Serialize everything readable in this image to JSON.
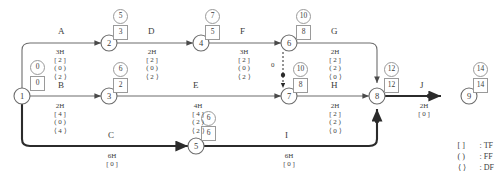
{
  "diagram": {
    "nodes": [
      {
        "id": "1",
        "label": "1",
        "earliest": "0",
        "latest": "0"
      },
      {
        "id": "2",
        "label": "2",
        "earliest": "5",
        "latest": "3"
      },
      {
        "id": "3",
        "label": "3",
        "earliest": "6",
        "latest": "2"
      },
      {
        "id": "4",
        "label": "4",
        "earliest": "7",
        "latest": "5"
      },
      {
        "id": "5",
        "label": "5",
        "earliest": "6",
        "latest": "6"
      },
      {
        "id": "6",
        "label": "6",
        "earliest": "10",
        "latest": "8"
      },
      {
        "id": "7",
        "label": "7",
        "earliest": "10",
        "latest": "8"
      },
      {
        "id": "8",
        "label": "8",
        "earliest": "12",
        "latest": "12"
      },
      {
        "id": "9",
        "label": "9",
        "earliest": "14",
        "latest": "14"
      }
    ],
    "activities": [
      {
        "name": "A",
        "from": "1",
        "to": "2",
        "duration": "3H",
        "tf": "[ 2 ]",
        "ff": "( 0 )",
        "df": "⟨ 2 ⟩"
      },
      {
        "name": "B",
        "from": "1",
        "to": "3",
        "duration": "2H",
        "tf": "[ 4 ]",
        "ff": "( 0 )",
        "df": "⟨ 4 ⟩"
      },
      {
        "name": "C",
        "from": "1",
        "to": "5",
        "duration": "6H",
        "tf": "[ 0 ]",
        "ff": "",
        "df": ""
      },
      {
        "name": "D",
        "from": "2",
        "to": "4",
        "duration": "2H",
        "tf": "[ 2 ]",
        "ff": "( 0 )",
        "df": "⟨ 2 ⟩"
      },
      {
        "name": "E",
        "from": "3",
        "to": "7",
        "duration": "4H",
        "tf": "[ 4 ]",
        "ff": "( 2 )",
        "df": "⟨ 2 ⟩"
      },
      {
        "name": "F",
        "from": "4",
        "to": "6",
        "duration": "3H",
        "tf": "[ 2 ]",
        "ff": "( 0 )",
        "df": "⟨ 2 ⟩"
      },
      {
        "name": "G",
        "from": "6",
        "to": "8",
        "duration": "2H",
        "tf": "[ 2 ]",
        "ff": "( 2 )",
        "df": "⟨ 0 ⟩"
      },
      {
        "name": "H",
        "from": "7",
        "to": "8",
        "duration": "2H",
        "tf": "[ 2 ]",
        "ff": "( 2 )",
        "df": "⟨ 0 ⟩"
      },
      {
        "name": "I",
        "from": "5",
        "to": "8",
        "duration": "6H",
        "tf": "[ 0 ]",
        "ff": "",
        "df": ""
      },
      {
        "name": "J",
        "from": "8",
        "to": "9",
        "duration": "2H",
        "tf": "[ 0 ]",
        "ff": "",
        "df": ""
      }
    ],
    "dummy": {
      "label": "0",
      "from": "6",
      "to": "7"
    },
    "legend": [
      {
        "symbol": "[   ]",
        "colon": ":",
        "meaning": "TF"
      },
      {
        "symbol": "(   )",
        "colon": ":",
        "meaning": "FF"
      },
      {
        "symbol": "⟨   ⟩",
        "colon": ":",
        "meaning": "DF"
      }
    ]
  }
}
